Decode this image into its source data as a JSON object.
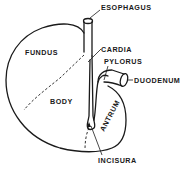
{
  "diagram": {
    "colors": {
      "ink": "#1a1a1a",
      "background": "#ffffff"
    },
    "labels": {
      "esophagus": "ESOPHAGUS",
      "fundus": "FUNDUS",
      "cardia": "CARDIA",
      "pylorus": "PYLORUS",
      "duodenum": "DUODENUM",
      "body": "BODY",
      "antrum": "ANTRUM",
      "incisura": "INCISURA"
    }
  }
}
